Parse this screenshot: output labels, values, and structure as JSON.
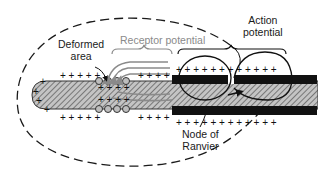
{
  "figure": {
    "labels": {
      "deformed_area": [
        "Deformed",
        "area"
      ],
      "receptor_potential": "Receptor potential",
      "action_potential": [
        "Action",
        "potential"
      ],
      "node_of_ranvier": [
        "Node of",
        "Ranvier"
      ]
    },
    "charges": {
      "positive": "+",
      "negative": "−"
    },
    "colors": {
      "outline": "#1a1a1a",
      "receptor_gray": "#8a8a8a",
      "myelin": "#111111",
      "axon_hatch_bg": "#bdbdbd",
      "axon_hatch_line": "#555555",
      "background": "#ffffff"
    }
  }
}
